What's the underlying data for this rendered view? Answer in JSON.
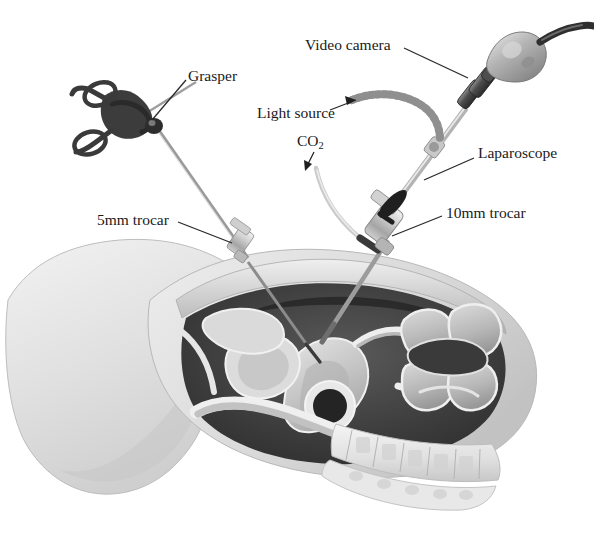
{
  "figure": {
    "name": "laparoscopic-surgery-diagram",
    "width": 594,
    "height": 533,
    "background": "#ffffff",
    "style": "grayscale medical illustration"
  },
  "labels": {
    "video_camera": "Video camera",
    "grasper": "Grasper",
    "light_source": "Light source",
    "co2": "CO",
    "co2_subscript": "2",
    "laparoscope": "Laparoscope",
    "trocar_5mm": "5mm trocar",
    "trocar_10mm": "10mm trocar"
  },
  "colors": {
    "label_text": "#1a1a1a",
    "leader_line": "#2a2a2a",
    "body_skin": "#e3e3e3",
    "body_skin_dark": "#c9c9c9",
    "cavity_dark": "#4a4a4a",
    "cavity_darkest": "#2e2e2e",
    "organ_light": "#d8d8d8",
    "organ_mid": "#b5b5b5",
    "instrument_light": "#d5d5d5",
    "instrument_dark": "#3a3a3a",
    "bone_light": "#ededed"
  },
  "instruments": [
    {
      "name": "grasper",
      "parts": [
        "ring-handles",
        "ratchet-body",
        "shaft",
        "jaw-tip"
      ],
      "entry": "5mm trocar",
      "side": "left"
    },
    {
      "name": "laparoscope",
      "parts": [
        "camera-head",
        "coupling-rings",
        "light-post",
        "shaft",
        "objective-tip"
      ],
      "entry": "10mm trocar",
      "side": "right"
    },
    {
      "name": "video-camera",
      "parts": [
        "camera-body",
        "cable"
      ]
    },
    {
      "name": "light-source-cable",
      "parts": [
        "flexible-ribbed-cable",
        "connector"
      ]
    },
    {
      "name": "co2-tube",
      "parts": [
        "insufflation-tubing",
        "stopcock-connector"
      ]
    }
  ],
  "anatomy": [
    "abdominal-wall",
    "peritoneal-cavity",
    "uterus",
    "bladder",
    "rectum",
    "bowel-loops",
    "vertebral-column",
    "sacrum",
    "thigh"
  ]
}
